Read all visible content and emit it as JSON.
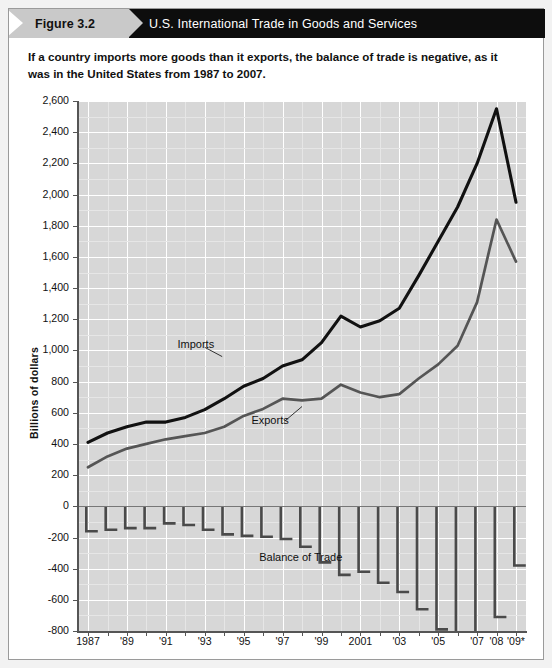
{
  "header": {
    "figure_label": "Figure 3.2",
    "title": "U.S. International Trade in Goods and Services"
  },
  "caption": "If a country imports more goods than it exports, the balance of trade is negative, as it was in the United States from 1987 to 2007.",
  "colors": {
    "header_bar": "#0d0d0d",
    "flag": "#c9c9c9",
    "plot_background": "#d7d7d7",
    "gridline": "#ffffff",
    "imports_line": "#111111",
    "exports_line": "#555555",
    "bars": "#4a4a4a",
    "axis": "#555555"
  },
  "chart_data": {
    "type": "line",
    "title": "U.S. International Trade in Goods and Services",
    "xlabel": "",
    "ylabel": "Billions of dollars",
    "ylim": [
      -800,
      2600
    ],
    "ytick_step": 200,
    "yticks": [
      "2,600",
      "2,400",
      "2,200",
      "2,000",
      "1,800",
      "1,600",
      "1,400",
      "1,200",
      "1,000",
      "800",
      "600",
      "400",
      "200",
      "0",
      "-200",
      "-400",
      "-600",
      "-800"
    ],
    "ytick_values": [
      2600,
      2400,
      2200,
      2000,
      1800,
      1600,
      1400,
      1200,
      1000,
      800,
      600,
      400,
      200,
      0,
      -200,
      -400,
      -600,
      -800
    ],
    "grid": true,
    "legend": "inline-annotations",
    "x": [
      1987,
      1988,
      1989,
      1990,
      1991,
      1992,
      1993,
      1994,
      1995,
      1996,
      1997,
      1998,
      1999,
      2000,
      2001,
      2002,
      2003,
      2004,
      2005,
      2006,
      2007,
      2008,
      2009
    ],
    "xtick_labels": [
      "1987",
      "'89",
      "'91",
      "'93",
      "'95",
      "'97",
      "'99",
      "2001",
      "'03",
      "'05",
      "'07",
      "'08",
      "'09*"
    ],
    "xtick_years": [
      1987,
      1989,
      1991,
      1993,
      1995,
      1997,
      1999,
      2001,
      2003,
      2005,
      2007,
      2008,
      2009
    ],
    "series": [
      {
        "name": "Imports",
        "color": "#111111",
        "values": [
          410,
          470,
          510,
          540,
          540,
          570,
          620,
          690,
          770,
          820,
          900,
          940,
          1050,
          1220,
          1150,
          1190,
          1270,
          1480,
          1700,
          1920,
          2200,
          2550,
          1950
        ]
      },
      {
        "name": "Exports",
        "color": "#555555",
        "values": [
          250,
          320,
          370,
          400,
          430,
          450,
          470,
          510,
          580,
          625,
          690,
          680,
          690,
          780,
          730,
          700,
          720,
          820,
          910,
          1030,
          1310,
          1840,
          1570
        ]
      },
      {
        "name": "Balance of Trade",
        "type": "bar",
        "color": "#4a4a4a",
        "values": [
          -160,
          -150,
          -140,
          -140,
          -110,
          -120,
          -150,
          -180,
          -190,
          -195,
          -210,
          -260,
          -360,
          -440,
          -420,
          -490,
          -550,
          -660,
          -790,
          -890,
          -890,
          -710,
          -380
        ]
      }
    ],
    "annotations": [
      {
        "text": "Imports",
        "x": 1991.6,
        "y": 1030
      },
      {
        "text": "Exports",
        "x": 1995.4,
        "y": 540
      },
      {
        "text": "Balance of Trade",
        "x": 1995.8,
        "y": -335
      }
    ]
  }
}
